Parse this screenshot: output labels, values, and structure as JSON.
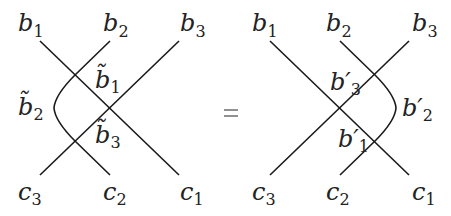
{
  "equation": {
    "relation": "=",
    "left": {
      "top_labels": [
        {
          "base": "b",
          "sub": "1"
        },
        {
          "base": "b",
          "sub": "2"
        },
        {
          "base": "b",
          "sub": "3"
        }
      ],
      "bottom_labels": [
        {
          "base": "c",
          "sub": "3"
        },
        {
          "base": "c",
          "sub": "2"
        },
        {
          "base": "c",
          "sub": "1"
        }
      ],
      "region_labels": [
        {
          "base": "b̃",
          "sub": "1",
          "position": "right of upper crossing"
        },
        {
          "base": "b̃",
          "sub": "2",
          "position": "left of curved strand"
        },
        {
          "base": "b̃",
          "sub": "3",
          "position": "right of lower crossing"
        }
      ],
      "curve_side": "left"
    },
    "right": {
      "top_labels": [
        {
          "base": "b",
          "sub": "1"
        },
        {
          "base": "b",
          "sub": "2"
        },
        {
          "base": "b",
          "sub": "3"
        }
      ],
      "bottom_labels": [
        {
          "base": "c",
          "sub": "3"
        },
        {
          "base": "c",
          "sub": "2"
        },
        {
          "base": "c",
          "sub": "1"
        }
      ],
      "region_labels": [
        {
          "base": "b′",
          "sub": "3",
          "position": "left of upper crossing"
        },
        {
          "base": "b′",
          "sub": "2",
          "position": "right of curved strand"
        },
        {
          "base": "b′",
          "sub": "1",
          "position": "left of lower crossing"
        }
      ],
      "curve_side": "right"
    }
  }
}
